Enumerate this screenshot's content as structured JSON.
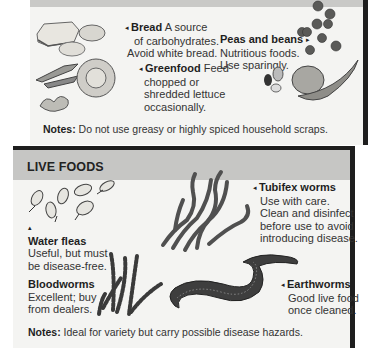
{
  "household_foods": {
    "items": [
      {
        "name": "Bread",
        "description_line1": "A source",
        "description_rest": [
          "of carbohydrates.",
          "Avoid white bread."
        ],
        "pointer": "left"
      },
      {
        "name": "Peas and beans",
        "description": [
          "Nutritious foods.",
          "Use sparingly."
        ],
        "pointer": "right"
      },
      {
        "name": "Greenfood",
        "description_line1": "Feed",
        "description_rest": [
          "chopped or",
          "shredded lettuce",
          "occasionally."
        ],
        "pointer": "left"
      }
    ],
    "notes_label": "Notes:",
    "notes_text": "Do not use greasy or highly spiced household scraps."
  },
  "live_foods": {
    "title": "LIVE FOODS",
    "items": [
      {
        "name": "Tubifex worms",
        "description": [
          "Use with care.",
          "Clean and disinfect",
          "before use to avoid",
          "introducing disease."
        ],
        "pointer": "left"
      },
      {
        "name": "Water fleas",
        "description": [
          "Useful, but must",
          "be disease-free."
        ],
        "pointer": "up"
      },
      {
        "name": "Bloodworms",
        "description": [
          "Excellent; buy",
          "from dealers."
        ],
        "pointer": "none"
      },
      {
        "name": "Earthworms",
        "description": [
          "Good live food",
          "once cleaned."
        ],
        "pointer": "left"
      }
    ],
    "notes_label": "Notes:",
    "notes_text": "Ideal for variety but carry possible disease hazards."
  },
  "icons": {
    "arrow_left": "◂",
    "arrow_right": "▸",
    "arrow_up": "▴"
  },
  "colors": {
    "panel_bg": "#f4f4f2",
    "header_bg": "#c6c6c4",
    "border": "#1e1e1e"
  }
}
